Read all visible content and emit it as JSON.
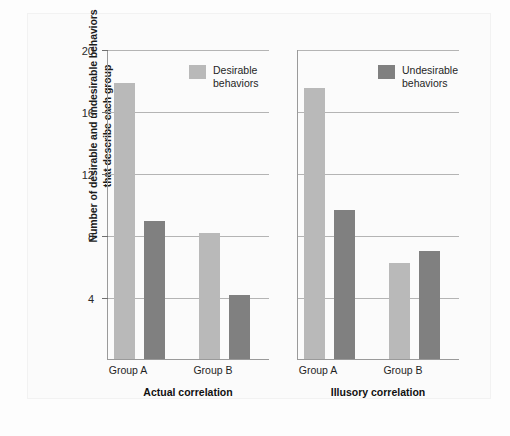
{
  "chart_data": {
    "type": "bar",
    "title": "",
    "xlabel": "",
    "ylabel": "Number of desirable and undesirable behaviors that describe each group",
    "ylim": [
      0,
      20
    ],
    "yticks": [
      4,
      8,
      12,
      16,
      20
    ],
    "ytick_labels": [
      "4",
      "8",
      "12",
      "16",
      "20"
    ],
    "grid": true,
    "legend_position": "top-right of each panel",
    "categories": [
      "Group A",
      "Group B"
    ],
    "series": [
      {
        "name": "Desirable behaviors",
        "color": "#b9b9b9"
      },
      {
        "name": "Undesirable behaviors",
        "color": "#808080"
      }
    ],
    "panels": [
      {
        "title": "Actual correlation",
        "legend": "Desirable\nbehaviors",
        "legend_series": "Desirable behaviors",
        "groups": [
          {
            "label": "Group A",
            "desirable": 17.8,
            "undesirable": 8.9
          },
          {
            "label": "Group B",
            "desirable": 8.1,
            "undesirable": 4.1
          }
        ]
      },
      {
        "title": "Illusory correlation",
        "legend": "Undesirable\nbehaviors",
        "legend_series": "Undesirable behaviors",
        "groups": [
          {
            "label": "Group A",
            "desirable": 17.5,
            "undesirable": 9.6
          },
          {
            "label": "Group B",
            "desirable": 6.2,
            "undesirable": 7.0
          }
        ]
      }
    ]
  },
  "colors": {
    "desirable": "#b9b9b9",
    "undesirable": "#808080",
    "gridline": "#b4b4b4",
    "axis": "#9a9a9a",
    "background": "#fbfbfb"
  }
}
